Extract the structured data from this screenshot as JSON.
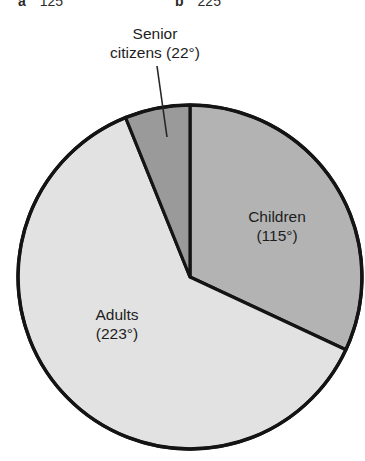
{
  "answers": [
    {
      "tag": "a",
      "value": "125"
    },
    {
      "tag": "b",
      "value": "225"
    }
  ],
  "callout": {
    "line1": "Senior",
    "line2": "citizens (22°)"
  },
  "labels": {
    "children": {
      "line1": "Children",
      "line2": "(115°)"
    },
    "adults": {
      "line1": "Adults",
      "line2": "(223°)"
    }
  },
  "colors": {
    "background": "#ffffff",
    "outline": "#141414",
    "children_fill": "#b3b3b3",
    "adults_fill": "#e2e2e2",
    "senior_fill": "#9a9a9a",
    "text": "#1d1d1d"
  },
  "chart_data": {
    "type": "pie",
    "title": "",
    "unit": "degrees",
    "total_degrees": 360,
    "start_angle_deg": 0,
    "direction": "clockwise",
    "categories": [
      "Children",
      "Adults",
      "Senior citizens"
    ],
    "values": [
      115,
      223,
      22
    ],
    "labels": [
      "Children (115°)",
      "Adults (223°)",
      "Senior citizens (22°)"
    ],
    "slice_colors": [
      "#b3b3b3",
      "#e2e2e2",
      "#9a9a9a"
    ],
    "legend": "none",
    "annotations": [
      "Senior citizens (22°) leader line to small top slice"
    ],
    "center_px": [
      190,
      277
    ],
    "radius_px": 172
  }
}
